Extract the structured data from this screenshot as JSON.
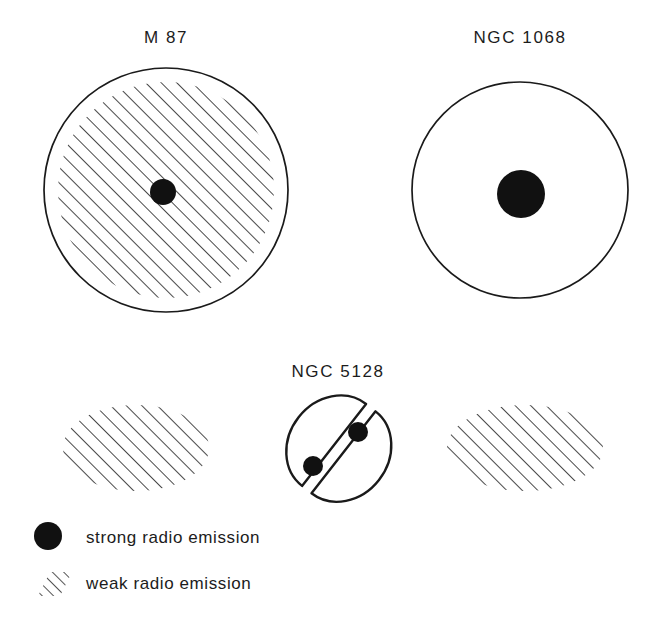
{
  "figure": {
    "title_absent": "",
    "background_color": "#ffffff",
    "ink_color": "#1a1a1a"
  },
  "objects": [
    {
      "id": "m87",
      "label": "M 87",
      "shape": "circle",
      "center": [
        166,
        190
      ],
      "radius": 122,
      "has_outline": true,
      "weak_emission_region": {
        "shape": "circle",
        "center": [
          166,
          190
        ],
        "radius": 108,
        "hatched": true
      },
      "strong_emission_core": {
        "shape": "circle",
        "center": [
          163,
          192
        ],
        "radius": 13
      }
    },
    {
      "id": "ngc1068",
      "label": "NGC 1068",
      "shape": "circle",
      "center": [
        520,
        190
      ],
      "radius": 108,
      "has_outline": true,
      "weak_emission_region": null,
      "strong_emission_core": {
        "shape": "circle",
        "center": [
          521,
          194
        ],
        "radius": 24
      }
    },
    {
      "id": "ngc5128",
      "label": "NGC 5128",
      "shape": "split-ellipse",
      "center": [
        338,
        448
      ],
      "radius_x": 52,
      "radius_y": 45,
      "dust_lane_angle_deg": -52,
      "has_outline": true,
      "strong_emission_cores": [
        {
          "center": [
            358,
            432
          ],
          "radius": 10
        },
        {
          "center": [
            313,
            466
          ],
          "radius": 10
        }
      ]
    }
  ],
  "lobes": [
    {
      "id": "ngc5128-lobe-left",
      "belongs_to": "ngc5128",
      "shape": "ellipse",
      "center": [
        136,
        448
      ],
      "radius_x": 73,
      "radius_y": 43,
      "hatched": true,
      "has_outline": false
    },
    {
      "id": "ngc5128-lobe-right",
      "belongs_to": "ngc5128",
      "shape": "ellipse",
      "center": [
        525,
        448
      ],
      "radius_x": 78,
      "radius_y": 43,
      "hatched": true,
      "has_outline": false
    }
  ],
  "hatching": {
    "angle_deg": 45,
    "spacing_px": 11,
    "stroke_width_px": 1.6,
    "color": "#1a1a1a",
    "direction": "lower-left to upper-right"
  },
  "legend": {
    "items": [
      {
        "swatch": "filled-circle",
        "label": "strong radio emission"
      },
      {
        "swatch": "hatched-parallelogram",
        "label": "weak radio emission"
      }
    ],
    "strong_label": "strong radio emission",
    "weak_label": "weak radio emission"
  }
}
